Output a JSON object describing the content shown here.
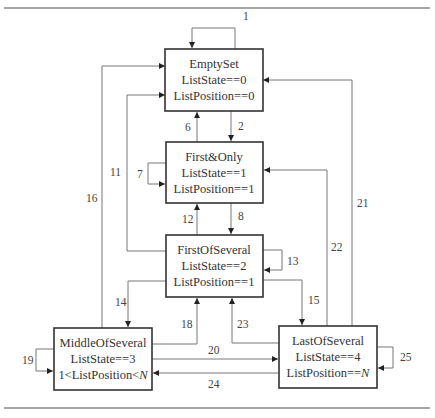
{
  "states": [
    {
      "id": "empty",
      "name": "EmptySet",
      "line2": "ListState==0",
      "line3": "ListPosition==0"
    },
    {
      "id": "first_only",
      "name": "First&Only",
      "line2": "ListState==1",
      "line3": "ListPosition==1"
    },
    {
      "id": "first_several",
      "name": "FirstOfSeveral",
      "line2": "ListState==2",
      "line3": "ListPosition==1"
    },
    {
      "id": "middle_several",
      "name": "MiddleOfSeveral",
      "line2": "ListState==3",
      "line3_pre": "1<ListPosition<",
      "line3_var": "N"
    },
    {
      "id": "last_several",
      "name": "LastOfSeveral",
      "line2": "ListState==4",
      "line3_pre": "ListPosition==",
      "line3_var": "N"
    }
  ],
  "transitions": [
    {
      "label": "1",
      "from": "EmptySet",
      "to": "EmptySet"
    },
    {
      "label": "2",
      "from": "EmptySet",
      "to": "First&Only"
    },
    {
      "label": "6",
      "from": "First&Only",
      "to": "EmptySet"
    },
    {
      "label": "7",
      "from": "First&Only",
      "to": "First&Only"
    },
    {
      "label": "8",
      "from": "First&Only",
      "to": "FirstOfSeveral"
    },
    {
      "label": "11",
      "from": "FirstOfSeveral",
      "to": "EmptySet"
    },
    {
      "label": "12",
      "from": "FirstOfSeveral",
      "to": "First&Only"
    },
    {
      "label": "13",
      "from": "FirstOfSeveral",
      "to": "FirstOfSeveral"
    },
    {
      "label": "14",
      "from": "FirstOfSeveral",
      "to": "MiddleOfSeveral"
    },
    {
      "label": "15",
      "from": "FirstOfSeveral",
      "to": "LastOfSeveral"
    },
    {
      "label": "16",
      "from": "MiddleOfSeveral",
      "to": "EmptySet"
    },
    {
      "label": "18",
      "from": "MiddleOfSeveral",
      "to": "FirstOfSeveral"
    },
    {
      "label": "19",
      "from": "MiddleOfSeveral",
      "to": "MiddleOfSeveral"
    },
    {
      "label": "20",
      "from": "MiddleOfSeveral",
      "to": "LastOfSeveral"
    },
    {
      "label": "21",
      "from": "LastOfSeveral",
      "to": "EmptySet"
    },
    {
      "label": "22",
      "from": "LastOfSeveral",
      "to": "First&Only"
    },
    {
      "label": "23",
      "from": "LastOfSeveral",
      "to": "FirstOfSeveral"
    },
    {
      "label": "24",
      "from": "LastOfSeveral",
      "to": "MiddleOfSeveral"
    },
    {
      "label": "25",
      "from": "LastOfSeveral",
      "to": "LastOfSeveral"
    }
  ],
  "colors": {
    "box_stroke": "#333333",
    "edge": "#777777",
    "text": "#333333",
    "rule": "#888888"
  }
}
